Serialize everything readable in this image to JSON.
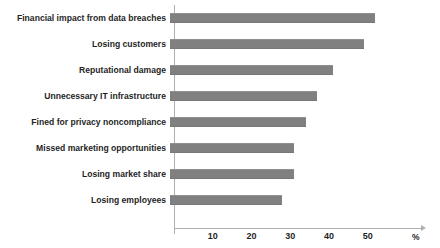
{
  "chart_data": {
    "type": "bar",
    "orientation": "horizontal",
    "title": "",
    "subtitle": "",
    "xlabel": "%",
    "ylabel": "",
    "categories": [
      "Financial impact from data breaches",
      "Losing customers",
      "Reputational damage",
      "Unnecessary IT infrastructure",
      "Fined for privacy noncompliance",
      "Missed marketing opportunities",
      "Losing market share",
      "Losing employees"
    ],
    "values": [
      53,
      50,
      42,
      38,
      35,
      32,
      32,
      29
    ],
    "series": [
      {
        "name": "Share of respondents",
        "values": [
          53,
          50,
          42,
          38,
          35,
          32,
          32,
          29
        ]
      }
    ],
    "xlim": [
      0,
      57
    ],
    "xticks": [
      10,
      20,
      30,
      40,
      50
    ],
    "xtick_labels": [
      "10",
      "20",
      "30",
      "40",
      "50"
    ],
    "grid": false,
    "legend": false,
    "legend_position": "none",
    "unit_label": "%",
    "bar_color": "#808080",
    "axis_color": "#b0b0b0",
    "text_color": "#1f1f1f",
    "background": "#ffffff",
    "annotations": []
  }
}
